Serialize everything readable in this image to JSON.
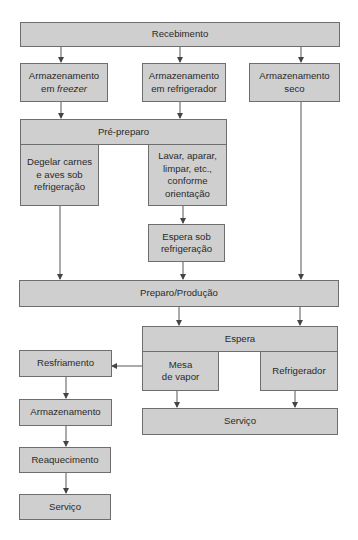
{
  "diagram": {
    "type": "flowchart",
    "language": "pt-BR",
    "colors": {
      "box_fill": "#cfcfcf",
      "box_border": "#6e6e6e",
      "arrow": "#444444",
      "text": "#2a2a2a"
    },
    "nodes": {
      "recebimento": {
        "label": "Recebimento"
      },
      "arm_freezer": {
        "line1": "Armazenamento",
        "line2_prefix": "em ",
        "line2_italic": "freezer"
      },
      "arm_refrigerador": {
        "line1": "Armazenamento",
        "line2": "em refrigerador"
      },
      "arm_seco": {
        "line1": "Armazenamento",
        "line2": "seco"
      },
      "pre_preparo": {
        "label": "Pré-preparo"
      },
      "degelar": {
        "line1": "Degelar carnes",
        "line2": "e aves sob",
        "line3": "refrigeração"
      },
      "lavar": {
        "line1": "Lavar, aparar,",
        "line2": "limpar, etc.,",
        "line3": "conforme",
        "line4": "orientação"
      },
      "espera_refrig": {
        "line1": "Espera sob",
        "line2": "refrigeração"
      },
      "preparo_producao": {
        "label": "Preparo/Produção"
      },
      "espera": {
        "label": "Espera"
      },
      "mesa_vapor": {
        "line1": "Mesa",
        "line2": "de vapor"
      },
      "refrigerador": {
        "label": "Refrigerador"
      },
      "servico_right": {
        "label": "Serviço"
      },
      "resfriamento": {
        "label": "Resfriamento"
      },
      "armazenamento": {
        "label": "Armazenamento"
      },
      "reaquecimento": {
        "label": "Reaquecimento"
      },
      "servico_left": {
        "label": "Serviço"
      }
    },
    "edges": [
      [
        "Recebimento",
        "Armazenamento em freezer"
      ],
      [
        "Recebimento",
        "Armazenamento em refrigerador"
      ],
      [
        "Recebimento",
        "Armazenamento seco"
      ],
      [
        "Armazenamento em freezer",
        "Pré-preparo"
      ],
      [
        "Armazenamento em refrigerador",
        "Pré-preparo"
      ],
      [
        "Armazenamento seco",
        "Preparo/Produção"
      ],
      [
        "Degelar carnes e aves sob refrigeração",
        "Preparo/Produção"
      ],
      [
        "Lavar, aparar, limpar, etc., conforme orientação",
        "Espera sob refrigeração"
      ],
      [
        "Espera sob refrigeração",
        "Preparo/Produção"
      ],
      [
        "Preparo/Produção",
        "Espera"
      ],
      [
        "Mesa de vapor",
        "Serviço"
      ],
      [
        "Refrigerador",
        "Serviço"
      ],
      [
        "Mesa de vapor",
        "Resfriamento"
      ],
      [
        "Resfriamento",
        "Armazenamento"
      ],
      [
        "Armazenamento",
        "Reaquecimento"
      ],
      [
        "Reaquecimento",
        "Serviço"
      ]
    ]
  }
}
